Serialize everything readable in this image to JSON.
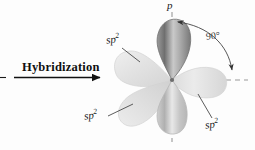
{
  "figure": {
    "background_color": "#fdfdfd",
    "process": {
      "label": "Hybridization",
      "arrow_direction": "right"
    },
    "axis_labels": {
      "p_orbital": "p",
      "angle": "90°"
    },
    "orbital_labels": {
      "upper_left": "sp",
      "upper_left_sup": "2",
      "lower_left": "sp",
      "lower_left_sup": "2",
      "lower_right": "sp",
      "lower_right_sup": "2"
    },
    "colors": {
      "p_orbital_dark": "#8c8c8c",
      "p_orbital_light": "#d8d8d8",
      "sp2_lobe": "#e4e4e4",
      "axis_dash": "#9a9a9a",
      "arrow_line": "#1a1a1a",
      "leader_line": "#555555",
      "text": "#1a1a1a"
    },
    "geometry": {
      "center_x": 172,
      "center_y": 80,
      "p_lobe_count": 2,
      "sp2_lobe_count": 3,
      "angle_value": 90
    }
  }
}
